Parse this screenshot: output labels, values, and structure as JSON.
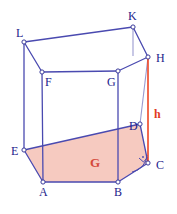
{
  "figure": {
    "title_strip": "",
    "caption": "",
    "type": "hexagonal prism",
    "colors": {
      "edge": "#4a4ab0",
      "edge_back": "#8f8fc6",
      "base_fill": "#f6c7bd",
      "height_line": "#ee4422",
      "label": "#23238c",
      "red_label": "#e23a24",
      "area_label": "#d4483a",
      "vertex_fill": "#ffffff",
      "background": "#ffffff"
    },
    "labels": {
      "A": "A",
      "B": "B",
      "C": "C",
      "D": "D",
      "E": "E",
      "F": "F",
      "G_top": "G",
      "H": "H",
      "K": "K",
      "L": "L",
      "height": "h",
      "base_area": "G"
    },
    "vertices": {
      "A": {
        "x": 43,
        "y": 182
      },
      "B": {
        "x": 118,
        "y": 182
      },
      "C": {
        "x": 148,
        "y": 163
      },
      "D": {
        "x": 140,
        "y": 124
      },
      "E": {
        "x": 24,
        "y": 150
      },
      "F": {
        "x": 42,
        "y": 72
      },
      "G": {
        "x": 118,
        "y": 71
      },
      "H": {
        "x": 148,
        "y": 57
      },
      "K": {
        "x": 133,
        "y": 27
      },
      "L": {
        "x": 24,
        "y": 42
      }
    },
    "label_positions": {
      "A": {
        "x": 39,
        "y": 196
      },
      "B": {
        "x": 114,
        "y": 196
      },
      "C": {
        "x": 156,
        "y": 169
      },
      "D": {
        "x": 130,
        "y": 130
      },
      "E": {
        "x": 12,
        "y": 155
      },
      "F": {
        "x": 46,
        "y": 85
      },
      "G_top": {
        "x": 108,
        "y": 85
      },
      "H": {
        "x": 156,
        "y": 61
      },
      "K": {
        "x": 128,
        "y": 20
      },
      "L": {
        "x": 17,
        "y": 36
      },
      "height": {
        "x": 155,
        "y": 114
      },
      "base_area": {
        "x": 94,
        "y": 165
      }
    },
    "annotations": {
      "right_angle_at": "C",
      "arc_at": "C"
    }
  }
}
